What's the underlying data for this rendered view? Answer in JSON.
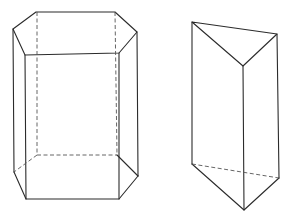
{
  "figure": {
    "colors": {
      "background": "#ffffff",
      "line": "#2b2b2b",
      "hidden_line": "#555555"
    },
    "shapes": [
      {
        "name": "hexagonal-prism",
        "top_face": [
          [
            36,
            12
          ],
          [
            115,
            12
          ],
          [
            137,
            32
          ],
          [
            119,
            53
          ],
          [
            25,
            55
          ],
          [
            13,
            29
          ]
        ],
        "bottom_visible": [
          [
            14,
            172
          ],
          [
            26,
            199
          ],
          [
            119,
            199
          ],
          [
            138,
            176
          ]
        ],
        "bottom_hidden_back": [
          [
            14,
            172
          ],
          [
            37,
            155
          ],
          [
            117,
            155
          ],
          [
            138,
            176
          ]
        ],
        "hidden_verticals": [
          [
            37,
            12,
            37,
            155
          ],
          [
            115,
            12,
            116,
            155
          ]
        ]
      },
      {
        "name": "triangular-prism",
        "top_face": [
          [
            192,
            22
          ],
          [
            277,
            34
          ],
          [
            243,
            66
          ]
        ],
        "bottom_visible": [
          [
            192,
            164
          ],
          [
            244,
            210
          ],
          [
            279,
            178
          ]
        ],
        "bottom_hidden": [
          [
            192,
            164
          ],
          [
            279,
            178
          ]
        ]
      }
    ]
  }
}
